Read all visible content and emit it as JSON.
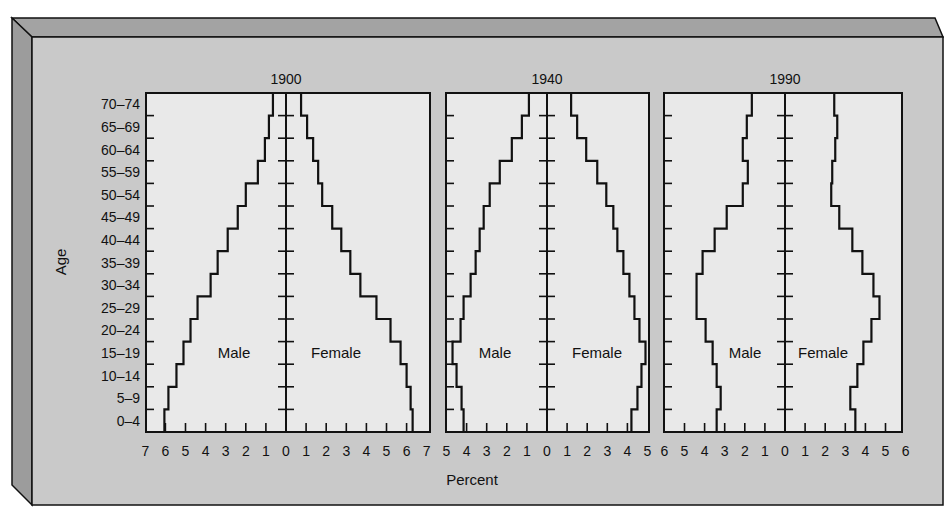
{
  "figure": {
    "y_axis_label": "Age",
    "x_axis_label": "Percent",
    "panel_series_labels": {
      "male": "Male",
      "female": "Female"
    }
  },
  "chart_data": [
    {
      "type": "bar",
      "subtype": "population-pyramid",
      "title": "1900",
      "xlabel": "Percent",
      "ylabel": "Age",
      "categories": [
        "0-4",
        "5-9",
        "10-14",
        "15-19",
        "20-24",
        "25-29",
        "30-34",
        "35-39",
        "40-44",
        "45-49",
        "50-54",
        "55-59",
        "60-64",
        "65-69",
        "70-74"
      ],
      "category_labels": [
        "0–4",
        "5–9",
        "10–14",
        "15–19",
        "20–24",
        "25–29",
        "30–34",
        "35–39",
        "40–44",
        "45–49",
        "50–54",
        "55–59",
        "60–64",
        "65–69",
        "70–74"
      ],
      "xlim": [
        0,
        7
      ],
      "x_ticks_left": [
        "7",
        "6",
        "5",
        "4",
        "3",
        "2",
        "1"
      ],
      "x_ticks_right": [
        "0",
        "1",
        "2",
        "3",
        "4",
        "5",
        "6",
        "7"
      ],
      "series": [
        {
          "name": "Male",
          "side": "left",
          "values": [
            6.05,
            5.85,
            5.45,
            5.1,
            4.75,
            4.4,
            3.75,
            3.4,
            2.9,
            2.4,
            2.0,
            1.4,
            1.05,
            0.85,
            0.65
          ]
        },
        {
          "name": "Female",
          "side": "right",
          "values": [
            6.3,
            6.2,
            6.0,
            5.7,
            5.2,
            4.5,
            3.7,
            3.2,
            2.75,
            2.3,
            1.8,
            1.6,
            1.35,
            1.05,
            0.75
          ]
        }
      ],
      "grid": false
    },
    {
      "type": "bar",
      "subtype": "population-pyramid",
      "title": "1940",
      "xlabel": "Percent",
      "ylabel": "Age",
      "categories": [
        "0-4",
        "5-9",
        "10-14",
        "15-19",
        "20-24",
        "25-29",
        "30-34",
        "35-39",
        "40-44",
        "45-49",
        "50-54",
        "55-59",
        "60-64",
        "65-69",
        "70-74"
      ],
      "xlim": [
        0,
        5
      ],
      "x_ticks_left": [
        "5",
        "4",
        "3",
        "2",
        "1"
      ],
      "x_ticks_right": [
        "0",
        "1",
        "2",
        "3",
        "4",
        "5"
      ],
      "series": [
        {
          "name": "Male",
          "side": "left",
          "values": [
            4.15,
            4.25,
            4.5,
            4.7,
            4.3,
            4.15,
            3.8,
            3.55,
            3.35,
            3.15,
            2.85,
            2.35,
            1.75,
            1.25,
            0.9
          ]
        },
        {
          "name": "Female",
          "side": "right",
          "values": [
            4.2,
            4.5,
            4.7,
            4.9,
            4.6,
            4.35,
            4.1,
            3.8,
            3.5,
            3.3,
            2.95,
            2.5,
            1.95,
            1.5,
            1.2
          ]
        }
      ],
      "grid": false
    },
    {
      "type": "bar",
      "subtype": "population-pyramid",
      "title": "1990",
      "xlabel": "Percent",
      "ylabel": "Age",
      "categories": [
        "0-4",
        "5-9",
        "10-14",
        "15-19",
        "20-24",
        "25-29",
        "30-34",
        "35-39",
        "40-44",
        "45-49",
        "50-54",
        "55-59",
        "60-64",
        "65-69",
        "70-74"
      ],
      "xlim": [
        0,
        6
      ],
      "x_ticks_left": [
        "6",
        "5",
        "4",
        "3",
        "2",
        "1"
      ],
      "x_ticks_right": [
        "0",
        "1",
        "2",
        "3",
        "4",
        "5",
        "6"
      ],
      "series": [
        {
          "name": "Male",
          "side": "left",
          "values": [
            3.4,
            3.2,
            3.4,
            3.6,
            3.95,
            4.4,
            4.4,
            4.1,
            3.5,
            2.9,
            2.1,
            1.85,
            2.1,
            1.9,
            1.65
          ]
        },
        {
          "name": "Female",
          "side": "right",
          "values": [
            3.5,
            3.25,
            3.6,
            3.9,
            4.3,
            4.7,
            4.4,
            3.85,
            3.35,
            2.7,
            2.3,
            2.35,
            2.5,
            2.6,
            2.45
          ]
        }
      ],
      "grid": false
    }
  ],
  "colors": {
    "frame_face": "#c9c9c9",
    "frame_top_bevel": "#a3a3a3",
    "frame_left_bevel": "#9c9c9c",
    "plot_bg": "#e9e9e9",
    "line": "#111111"
  }
}
